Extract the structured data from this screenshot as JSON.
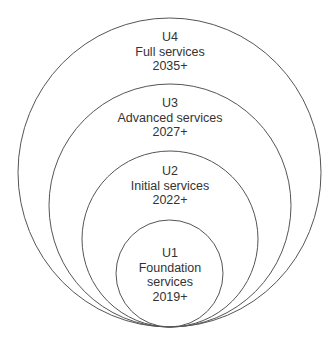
{
  "diagram": {
    "type": "nested-circles",
    "stroke_color": "#555555",
    "text_color": "#333333",
    "circles": [
      {
        "id": "U4",
        "level": "U4",
        "name": "Full services",
        "year": "2035+"
      },
      {
        "id": "U3",
        "level": "U3",
        "name": "Advanced services",
        "year": "2027+"
      },
      {
        "id": "U2",
        "level": "U2",
        "name": "Initial services",
        "year": "2022+"
      },
      {
        "id": "U1",
        "level": "U1",
        "name_line1": "Foundation",
        "name_line2": "services",
        "year": "2019+"
      }
    ]
  }
}
